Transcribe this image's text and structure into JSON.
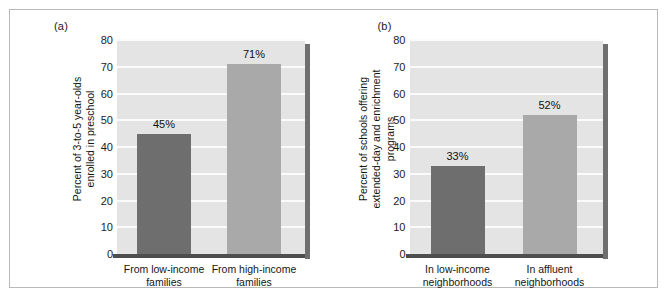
{
  "figure": {
    "panel_a_label": "(a)",
    "panel_b_label": "(b)"
  },
  "colors": {
    "bar_dark": "#6e6e6e",
    "bar_light": "#a9a9a9",
    "plot_background": "#e4e4e4",
    "gridline": "#fbfbfb",
    "axis": "#4e4e4e",
    "frame": "#b9b9b9"
  },
  "chart_data": [
    {
      "type": "bar",
      "panel": "(a)",
      "title": "",
      "xlabel": "",
      "ylabel": "Percent of 3-to-5 year-olds enrolled in preschool",
      "ylabel_lines": [
        "Percent of 3-to-5 year-olds",
        "enrolled in preschool"
      ],
      "categories": [
        "From low-income families",
        "From high-income families"
      ],
      "category_lines": [
        [
          "From low-income",
          "families"
        ],
        [
          "From high-income",
          "families"
        ]
      ],
      "values": [
        45,
        71
      ],
      "data_labels": [
        "45%",
        "71%"
      ],
      "bar_colors": [
        "#6e6e6e",
        "#a9a9a9"
      ],
      "ylim": [
        0,
        80
      ],
      "yticks": [
        0,
        10,
        20,
        30,
        40,
        50,
        60,
        70,
        80
      ],
      "ytick_labels": [
        "0",
        "10",
        "20",
        "30",
        "40",
        "50",
        "60",
        "70",
        "80"
      ],
      "grid": true,
      "legend": "none"
    },
    {
      "type": "bar",
      "panel": "(b)",
      "title": "",
      "xlabel": "",
      "ylabel": "Percent of schools offering extended-day and enrichment programs",
      "ylabel_lines": [
        "Percent of schools offering",
        "extended-day and enrichment",
        "programs"
      ],
      "categories": [
        "In low-income neighborhoods",
        "In affluent neighborhoods"
      ],
      "category_lines": [
        [
          "In low-income",
          "neighborhoods"
        ],
        [
          "In affluent",
          "neighborhoods"
        ]
      ],
      "values": [
        33,
        52
      ],
      "data_labels": [
        "33%",
        "52%"
      ],
      "bar_colors": [
        "#6e6e6e",
        "#a9a9a9"
      ],
      "ylim": [
        0,
        80
      ],
      "yticks": [
        0,
        10,
        20,
        30,
        40,
        50,
        60,
        70,
        80
      ],
      "ytick_labels": [
        "0",
        "10",
        "20",
        "30",
        "40",
        "50",
        "60",
        "70",
        "80"
      ],
      "grid": true,
      "legend": "none"
    }
  ]
}
